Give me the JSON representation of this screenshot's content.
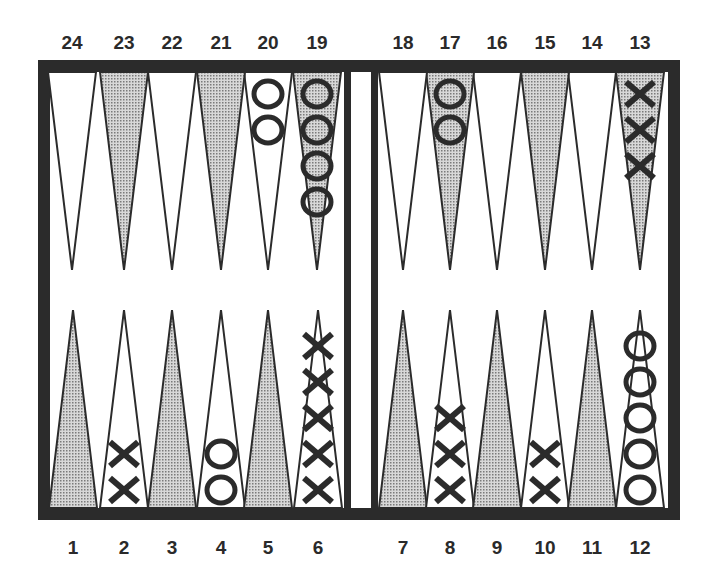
{
  "board": {
    "colors": {
      "frame": "#2b2b2b",
      "shade": "#b9b9b9",
      "field": "#ffffff",
      "piece": "#2b2b2b"
    },
    "frame": {
      "x": 38,
      "y": 60,
      "w": 642,
      "h": 460,
      "border": 12
    },
    "bar": {
      "left": 344,
      "right": 378
    },
    "top_label_y": 32,
    "bottom_label_y": 537,
    "points": [
      {
        "n": "1",
        "cx": 73,
        "row": "bottom",
        "shaded": true,
        "checkers": {
          "type": "",
          "count": 0
        }
      },
      {
        "n": "2",
        "cx": 124,
        "row": "bottom",
        "shaded": false,
        "checkers": {
          "type": "X",
          "count": 2
        }
      },
      {
        "n": "3",
        "cx": 172,
        "row": "bottom",
        "shaded": true,
        "checkers": {
          "type": "",
          "count": 0
        }
      },
      {
        "n": "4",
        "cx": 221,
        "row": "bottom",
        "shaded": false,
        "checkers": {
          "type": "O",
          "count": 2
        }
      },
      {
        "n": "5",
        "cx": 268,
        "row": "bottom",
        "shaded": true,
        "checkers": {
          "type": "",
          "count": 0
        }
      },
      {
        "n": "6",
        "cx": 318,
        "row": "bottom",
        "shaded": false,
        "checkers": {
          "type": "X",
          "count": 5
        }
      },
      {
        "n": "7",
        "cx": 403,
        "row": "bottom",
        "shaded": true,
        "checkers": {
          "type": "",
          "count": 0
        }
      },
      {
        "n": "8",
        "cx": 450,
        "row": "bottom",
        "shaded": false,
        "checkers": {
          "type": "X",
          "count": 3
        }
      },
      {
        "n": "9",
        "cx": 497,
        "row": "bottom",
        "shaded": true,
        "checkers": {
          "type": "",
          "count": 0
        }
      },
      {
        "n": "10",
        "cx": 545,
        "row": "bottom",
        "shaded": false,
        "checkers": {
          "type": "X",
          "count": 2
        }
      },
      {
        "n": "11",
        "cx": 592,
        "row": "bottom",
        "shaded": true,
        "checkers": {
          "type": "",
          "count": 0
        }
      },
      {
        "n": "12",
        "cx": 640,
        "row": "bottom",
        "shaded": false,
        "checkers": {
          "type": "O",
          "count": 5
        }
      },
      {
        "n": "13",
        "cx": 640,
        "row": "top",
        "shaded": true,
        "checkers": {
          "type": "X",
          "count": 3
        }
      },
      {
        "n": "14",
        "cx": 592,
        "row": "top",
        "shaded": false,
        "checkers": {
          "type": "",
          "count": 0
        }
      },
      {
        "n": "15",
        "cx": 545,
        "row": "top",
        "shaded": true,
        "checkers": {
          "type": "",
          "count": 0
        }
      },
      {
        "n": "16",
        "cx": 497,
        "row": "top",
        "shaded": false,
        "checkers": {
          "type": "",
          "count": 0
        }
      },
      {
        "n": "17",
        "cx": 450,
        "row": "top",
        "shaded": true,
        "checkers": {
          "type": "O",
          "count": 2
        }
      },
      {
        "n": "18",
        "cx": 403,
        "row": "top",
        "shaded": false,
        "checkers": {
          "type": "",
          "count": 0
        }
      },
      {
        "n": "19",
        "cx": 317,
        "row": "top",
        "shaded": true,
        "checkers": {
          "type": "O",
          "count": 4
        }
      },
      {
        "n": "20",
        "cx": 268,
        "row": "top",
        "shaded": false,
        "checkers": {
          "type": "O",
          "count": 2
        }
      },
      {
        "n": "21",
        "cx": 221,
        "row": "top",
        "shaded": true,
        "checkers": {
          "type": "",
          "count": 0
        }
      },
      {
        "n": "22",
        "cx": 172,
        "row": "top",
        "shaded": false,
        "checkers": {
          "type": "",
          "count": 0
        }
      },
      {
        "n": "23",
        "cx": 124,
        "row": "top",
        "shaded": true,
        "checkers": {
          "type": "",
          "count": 0
        }
      },
      {
        "n": "24",
        "cx": 72,
        "row": "top",
        "shaded": false,
        "checkers": {
          "type": "",
          "count": 0
        }
      }
    ]
  }
}
